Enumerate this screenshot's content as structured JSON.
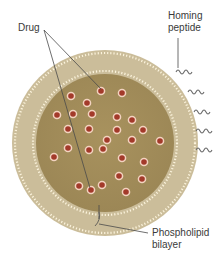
{
  "labels": {
    "drug": "Drug",
    "homing_peptide": [
      "Homing",
      "peptide"
    ],
    "phospholipid_bilayer": [
      "Phospholipid",
      "bilayer"
    ]
  },
  "colors": {
    "outer_membrane": "#c9bb98",
    "inner_core": "#a8935f",
    "drug_fill": "#a33a2a",
    "drug_ring": "#f3d3c0",
    "lipid_dots": "#fbf3dc",
    "peptide": "#6b6b6b",
    "leader": "#4a4a4a"
  },
  "drugs": [
    [
      101,
      91
    ],
    [
      122,
      93
    ],
    [
      71,
      96
    ],
    [
      87,
      103
    ],
    [
      57,
      115
    ],
    [
      73,
      114
    ],
    [
      92,
      114
    ],
    [
      117,
      117
    ],
    [
      132,
      120
    ],
    [
      68,
      129
    ],
    [
      89,
      129
    ],
    [
      117,
      130
    ],
    [
      143,
      130
    ],
    [
      107,
      140
    ],
    [
      132,
      140
    ],
    [
      160,
      141
    ],
    [
      68,
      148
    ],
    [
      89,
      150
    ],
    [
      103,
      149
    ],
    [
      54,
      157
    ],
    [
      122,
      158
    ],
    [
      144,
      162
    ],
    [
      119,
      176
    ],
    [
      142,
      179
    ],
    [
      79,
      186
    ],
    [
      91,
      190
    ],
    [
      102,
      185
    ],
    [
      126,
      192
    ]
  ],
  "peptides": [
    [
      176,
      72
    ],
    [
      188,
      92
    ],
    [
      194,
      112
    ],
    [
      196,
      131
    ],
    [
      196,
      150
    ]
  ]
}
